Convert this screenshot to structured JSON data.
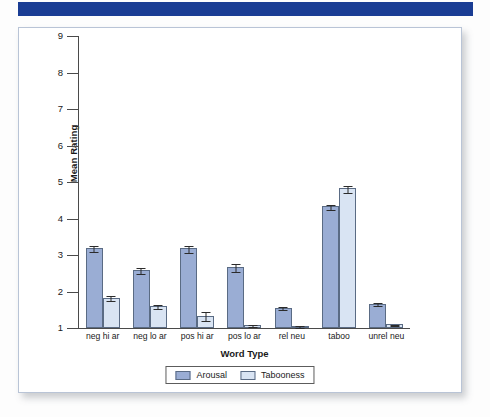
{
  "banner": {
    "color": "#1a3d94"
  },
  "chart_data": {
    "type": "bar",
    "title": "",
    "xlabel": "Word Type",
    "ylabel": "Mean Rating",
    "ylim": [
      1,
      9
    ],
    "yticks": [
      1,
      2,
      3,
      4,
      5,
      6,
      7,
      8,
      9
    ],
    "grid": false,
    "legend_position": "bottom",
    "categories": [
      "neg hi ar",
      "neg lo ar",
      "pos hi ar",
      "pos lo ar",
      "rel neu",
      "taboo",
      "unrel neu"
    ],
    "series": [
      {
        "name": "Arousal",
        "color": "#9aadd4",
        "values": [
          3.2,
          2.58,
          3.18,
          2.67,
          1.55,
          4.34,
          1.67
        ],
        "errors": [
          0.08,
          0.08,
          0.1,
          0.1,
          0.04,
          0.07,
          0.04
        ]
      },
      {
        "name": "Tabooness",
        "color": "#d9e4f3",
        "values": [
          1.83,
          1.6,
          1.34,
          1.08,
          1.06,
          4.83,
          1.1
        ],
        "errors": [
          0.07,
          0.06,
          0.12,
          0.02,
          0.02,
          0.1,
          0.02
        ]
      }
    ]
  }
}
